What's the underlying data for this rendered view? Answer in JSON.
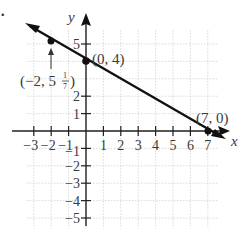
{
  "chart_data": {
    "type": "line",
    "title": "",
    "xlabel": "x",
    "ylabel": "y",
    "xlim": [
      -3.5,
      8
    ],
    "ylim": [
      -5.5,
      6
    ],
    "grid": true,
    "x_ticks": [
      -3,
      -2,
      -1,
      1,
      2,
      3,
      4,
      5,
      6,
      7
    ],
    "y_ticks": [
      -5,
      -4,
      -3,
      -2,
      -1,
      1,
      2,
      5
    ],
    "x_tick_labels": [
      "−3",
      "−2",
      "−1",
      "1",
      "2",
      "3",
      "4",
      "5",
      "6",
      "7"
    ],
    "y_tick_labels": [
      "−5",
      "−4",
      "−3",
      "−2",
      "−1",
      "1",
      "2",
      "5"
    ],
    "series": [
      {
        "name": "line",
        "x": [
          -3.5,
          7.6
        ],
        "y": [
          6.0,
          -0.35
        ],
        "equation": "y = -4/7 x + 4"
      }
    ],
    "points": [
      {
        "x": -2,
        "y": 5.142857,
        "label": "(−2, 5",
        "label_frac": "1/7",
        "label_close": ")"
      },
      {
        "x": 0,
        "y": 4,
        "label": "(0, 4)"
      },
      {
        "x": 7,
        "y": 0,
        "label": "(7, 0)"
      }
    ],
    "bullet": "."
  }
}
